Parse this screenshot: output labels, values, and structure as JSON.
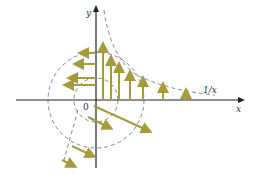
{
  "diagram": {
    "title": "",
    "labels": {
      "y_axis": "y",
      "x_axis": "x",
      "origin": "0",
      "curve": "1/x"
    },
    "colors": {
      "arrow": "#a59a3c",
      "axis": "#222222",
      "dashed": "#666677",
      "text": "#333333"
    },
    "axes": {
      "origin_px": [
        96,
        100
      ],
      "x_axis_range_px": [
        16,
        245
      ],
      "y_axis_range_px": [
        5,
        168
      ]
    },
    "circles": [
      {
        "name": "inner-circle",
        "cx": 96,
        "cy": 100,
        "r": 22
      },
      {
        "name": "outer-circle",
        "cx": 96,
        "cy": 100,
        "r": 48
      }
    ],
    "curve": {
      "name": "1/x",
      "description": "dashed hyperbola from near y-axis top down toward x-axis at right"
    },
    "vector_field": {
      "upward_arrows": [
        {
          "x": 103,
          "y0": 100,
          "y1": 42
        },
        {
          "x": 111,
          "y0": 100,
          "y1": 55
        },
        {
          "x": 119,
          "y0": 100,
          "y1": 62
        },
        {
          "x": 130,
          "y0": 100,
          "y1": 70
        },
        {
          "x": 143,
          "y0": 100,
          "y1": 76
        },
        {
          "x": 163,
          "y0": 100,
          "y1": 82
        },
        {
          "x": 186,
          "y0": 100,
          "y1": 88
        }
      ],
      "leftward_arrows": [
        {
          "y": 53,
          "x0": 96,
          "x1": 78
        },
        {
          "y": 64,
          "x0": 96,
          "x1": 73
        },
        {
          "y": 78,
          "x0": 96,
          "x1": 67
        },
        {
          "y": 85,
          "x0": 96,
          "x1": 63
        }
      ],
      "diagonal_arrows": [
        {
          "x0": 96,
          "y0": 107,
          "x1": 152,
          "y1": 132
        },
        {
          "x0": 88,
          "y0": 117,
          "x1": 113,
          "y1": 130
        },
        {
          "x0": 74,
          "y0": 147,
          "x1": 96,
          "y1": 157
        },
        {
          "x0": 63,
          "y0": 160,
          "x1": 77,
          "y1": 167
        }
      ]
    }
  }
}
